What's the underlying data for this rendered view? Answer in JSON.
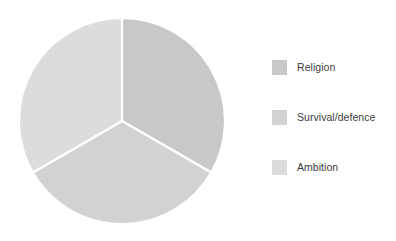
{
  "chart_data": {
    "type": "pie",
    "title": "",
    "subtitle": "",
    "xlabel": "",
    "ylabel": "",
    "categories": [
      "Religion",
      "Survival/defence",
      "Ambition"
    ],
    "values": [
      33.3,
      33.3,
      33.3
    ],
    "slices": [
      {
        "label": "Religion",
        "value": 33.3,
        "color": "#c8c8c8",
        "start_angle_deg": 0,
        "end_angle_deg": 120
      },
      {
        "label": "Survival/defence",
        "value": 33.3,
        "color": "#d2d2d2",
        "start_angle_deg": 120,
        "end_angle_deg": 240
      },
      {
        "label": "Ambition",
        "value": 33.3,
        "color": "#dcdcdc",
        "start_angle_deg": 240,
        "end_angle_deg": 360
      }
    ],
    "slice_border_color": "#ffffff",
    "legend_position": "right",
    "grid": false,
    "start_angle_deg": 0,
    "direction": "clockwise"
  },
  "legend": {
    "items": [
      {
        "label": "Religion",
        "color": "#c8c8c8"
      },
      {
        "label": "Survival/defence",
        "color": "#d2d2d2"
      },
      {
        "label": "Ambition",
        "color": "#dcdcdc"
      }
    ]
  },
  "geometry": {
    "center_x": 104,
    "center_y": 104,
    "radius": 103
  }
}
